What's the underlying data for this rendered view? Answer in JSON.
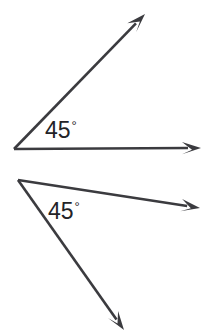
{
  "figure": {
    "type": "geometry-diagram",
    "background_color": "#ffffff",
    "stroke_color": "#3b3b3f",
    "text_color": "#232327",
    "width": 219,
    "height": 332,
    "angles": [
      {
        "id": "angle-top",
        "label_value": "45",
        "degree_symbol": "°",
        "measure_degrees": 45,
        "vertex": {
          "x": 14,
          "y": 149
        },
        "rays": [
          {
            "name": "ray-top-upper",
            "from": {
              "x": 14,
              "y": 149
            },
            "to": {
              "x": 145,
              "y": 14
            },
            "arrowhead": true,
            "direction_degrees": 46
          },
          {
            "name": "ray-top-horizontal",
            "from": {
              "x": 14,
              "y": 149
            },
            "to": {
              "x": 201,
              "y": 148
            },
            "arrowhead": true,
            "direction_degrees": 0
          }
        ],
        "label_position": {
          "x": 45,
          "y": 118
        }
      },
      {
        "id": "angle-bottom",
        "label_value": "45",
        "degree_symbol": "°",
        "measure_degrees": 45,
        "vertex": {
          "x": 18,
          "y": 180
        },
        "rays": [
          {
            "name": "ray-bottom-upper",
            "from": {
              "x": 18,
              "y": 180
            },
            "to": {
              "x": 200,
              "y": 208
            },
            "arrowhead": true,
            "direction_degrees": -9
          },
          {
            "name": "ray-bottom-lower",
            "from": {
              "x": 18,
              "y": 180
            },
            "to": {
              "x": 124,
              "y": 330
            },
            "arrowhead": true,
            "direction_degrees": -55
          }
        ],
        "label_position": {
          "x": 48,
          "y": 199
        }
      }
    ]
  }
}
